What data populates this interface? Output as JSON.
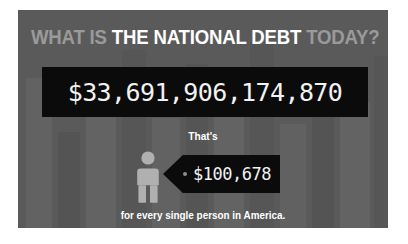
{
  "panel": {
    "background_color": "#5a5a5a",
    "bar_color": "#0b0b0b"
  },
  "headline": {
    "prefix": "WHAT IS ",
    "emphasis": "THE NATIONAL DEBT",
    "suffix": " TODAY?",
    "dim_color": "#9a9a9a",
    "bright_color": "#ffffff"
  },
  "debt": {
    "value": "$33,691,906,174,870"
  },
  "per_person": {
    "lead_in": "That's",
    "amount": "$100,678",
    "caption": "for every single person in America.",
    "person_icon_color": "#b0b0b0"
  },
  "background_bars": [
    {
      "left": 8,
      "width": 26,
      "height": 150,
      "color": "#626262"
    },
    {
      "left": 40,
      "width": 22,
      "height": 96,
      "color": "#545454"
    },
    {
      "left": 68,
      "width": 30,
      "height": 132,
      "color": "#636363"
    },
    {
      "left": 104,
      "width": 24,
      "height": 178,
      "color": "#565656"
    },
    {
      "left": 134,
      "width": 28,
      "height": 110,
      "color": "#626262"
    },
    {
      "left": 168,
      "width": 22,
      "height": 164,
      "color": "#555555"
    },
    {
      "left": 196,
      "width": 30,
      "height": 120,
      "color": "#636363"
    },
    {
      "left": 232,
      "width": 24,
      "height": 186,
      "color": "#565656"
    },
    {
      "left": 262,
      "width": 26,
      "height": 104,
      "color": "#616161"
    },
    {
      "left": 294,
      "width": 22,
      "height": 156,
      "color": "#545454"
    },
    {
      "left": 322,
      "width": 30,
      "height": 126,
      "color": "#636363"
    },
    {
      "left": 356,
      "width": 20,
      "height": 172,
      "color": "#565656"
    }
  ]
}
